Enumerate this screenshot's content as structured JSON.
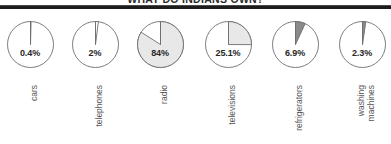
{
  "chart_data": {
    "type": "pie",
    "title": "WHAT DO INDIANS OWN?",
    "xlabel": "",
    "ylabel": "",
    "grid": false,
    "legend": "none",
    "note": "Six separate single-value pie charts; each pie shows the percentage of Indian households owning the item, drawn clockwise from 12 o'clock.",
    "categories": [
      "cars",
      "telephones",
      "radio",
      "televisions",
      "refrigerators",
      "washing machines"
    ],
    "values": [
      0.4,
      2,
      84,
      25.1,
      6.9,
      2.3
    ],
    "value_labels": [
      "0.4%",
      "2%",
      "84%",
      "25.1%",
      "6.9%",
      "2.3%"
    ],
    "slice_colors": [
      "#ffffff",
      "#ffffff",
      "#e8e8e8",
      "#e8e8e8",
      "#8a8a8a",
      "#8a8a8a"
    ],
    "remainder_color": "#ffffff",
    "outline_color": "#6e6e6e"
  },
  "title": {
    "text": "WHAT DO INDIANS OWN?"
  },
  "pies": [
    {
      "category": "cars",
      "category_lines": [
        "cars"
      ],
      "value": 0.4,
      "value_label": "0.4%",
      "slice_color": "#ffffff"
    },
    {
      "category": "telephones",
      "category_lines": [
        "telephones"
      ],
      "value": 2,
      "value_label": "2%",
      "slice_color": "#ffffff"
    },
    {
      "category": "radio",
      "category_lines": [
        "radio"
      ],
      "value": 84,
      "value_label": "84%",
      "slice_color": "#e8e8e8"
    },
    {
      "category": "televisions",
      "category_lines": [
        "televisions"
      ],
      "value": 25.1,
      "value_label": "25.1%",
      "slice_color": "#e8e8e8"
    },
    {
      "category": "refrigerators",
      "category_lines": [
        "refrigerators"
      ],
      "value": 6.9,
      "value_label": "6.9%",
      "slice_color": "#8a8a8a"
    },
    {
      "category": "washing machines",
      "category_lines": [
        "washing",
        "machines"
      ],
      "value": 2.3,
      "value_label": "2.3%",
      "slice_color": "#8a8a8a"
    }
  ]
}
